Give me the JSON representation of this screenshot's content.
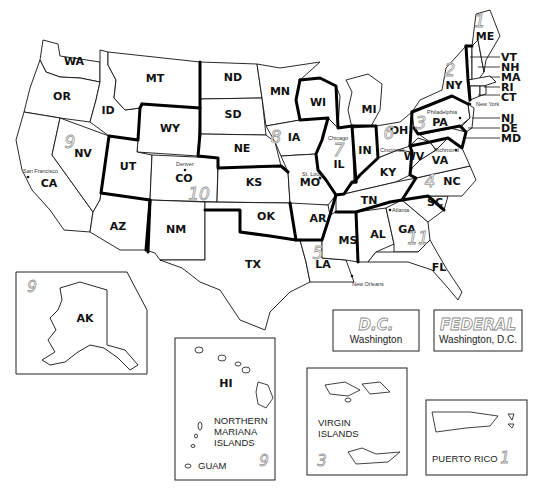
{
  "states": [
    {
      "code": "WA",
      "x": 74,
      "y": 65
    },
    {
      "code": "OR",
      "x": 62,
      "y": 100
    },
    {
      "code": "CA",
      "x": 49,
      "y": 187
    },
    {
      "code": "NV",
      "x": 83,
      "y": 157
    },
    {
      "code": "ID",
      "x": 108,
      "y": 114
    },
    {
      "code": "MT",
      "x": 155,
      "y": 82
    },
    {
      "code": "WY",
      "x": 170,
      "y": 132
    },
    {
      "code": "UT",
      "x": 128,
      "y": 170
    },
    {
      "code": "CO",
      "x": 184,
      "y": 182
    },
    {
      "code": "AZ",
      "x": 118,
      "y": 230
    },
    {
      "code": "NM",
      "x": 176,
      "y": 233
    },
    {
      "code": "ND",
      "x": 233,
      "y": 81
    },
    {
      "code": "SD",
      "x": 233,
      "y": 118
    },
    {
      "code": "NE",
      "x": 242,
      "y": 152
    },
    {
      "code": "KS",
      "x": 254,
      "y": 186
    },
    {
      "code": "OK",
      "x": 266,
      "y": 220
    },
    {
      "code": "TX",
      "x": 253,
      "y": 268
    },
    {
      "code": "MN",
      "x": 280,
      "y": 95
    },
    {
      "code": "IA",
      "x": 294,
      "y": 141
    },
    {
      "code": "MO",
      "x": 310,
      "y": 186
    },
    {
      "code": "AR",
      "x": 318,
      "y": 222
    },
    {
      "code": "LA",
      "x": 323,
      "y": 268
    },
    {
      "code": "WI",
      "x": 318,
      "y": 106
    },
    {
      "code": "IL",
      "x": 339,
      "y": 165
    },
    {
      "code": "MI",
      "x": 369,
      "y": 113
    },
    {
      "code": "IN",
      "x": 365,
      "y": 154
    },
    {
      "code": "OH",
      "x": 399,
      "y": 132
    },
    {
      "code": "KY",
      "x": 388,
      "y": 174
    },
    {
      "code": "TN",
      "x": 369,
      "y": 204
    },
    {
      "code": "MS",
      "x": 348,
      "y": 241
    },
    {
      "code": "AL",
      "x": 378,
      "y": 236
    },
    {
      "code": "GA",
      "x": 407,
      "y": 233
    },
    {
      "code": "FL",
      "x": 439,
      "y": 271
    },
    {
      "code": "SC",
      "x": 435,
      "y": 204
    },
    {
      "code": "NC",
      "x": 452,
      "y": 182
    },
    {
      "code": "VA",
      "x": 440,
      "y": 162
    },
    {
      "code": "WV",
      "x": 414,
      "y": 156
    },
    {
      "code": "PA",
      "x": 440,
      "y": 122
    },
    {
      "code": "NY",
      "x": 454,
      "y": 85
    },
    {
      "code": "ME",
      "x": 485,
      "y": 37
    }
  ],
  "leader_labels": [
    {
      "code": "VT",
      "y": 57
    },
    {
      "code": "NH",
      "y": 67
    },
    {
      "code": "MA",
      "y": 77
    },
    {
      "code": "RI",
      "y": 87
    },
    {
      "code": "CT",
      "y": 97
    },
    {
      "code": "NJ",
      "y": 118
    },
    {
      "code": "DE",
      "y": 128
    },
    {
      "code": "MD",
      "y": 138
    }
  ],
  "cities": [
    {
      "name": "San Francisco",
      "x": 23,
      "y": 170
    },
    {
      "name": "Denver",
      "x": 176,
      "y": 164
    },
    {
      "name": "St. Louis",
      "x": 300,
      "y": 174
    },
    {
      "name": "Chicago",
      "x": 328,
      "y": 138
    },
    {
      "name": "Cincinnati",
      "x": 382,
      "y": 150
    },
    {
      "name": "Philadelphia",
      "x": 426,
      "y": 112
    },
    {
      "name": "New York",
      "x": 476,
      "y": 104
    },
    {
      "name": "Richmond",
      "x": 432,
      "y": 150
    },
    {
      "name": "Atlanta",
      "x": 390,
      "y": 210
    },
    {
      "name": "New Orleans",
      "x": 352,
      "y": 285
    }
  ],
  "circuit_numbers": [
    {
      "n": "1",
      "x": 480,
      "y": 27
    },
    {
      "n": "2",
      "x": 450,
      "y": 75
    },
    {
      "n": "3",
      "x": 421,
      "y": 127
    },
    {
      "n": "4",
      "x": 430,
      "y": 185
    },
    {
      "n": "5",
      "x": 318,
      "y": 257
    },
    {
      "n": "6",
      "x": 389,
      "y": 137
    },
    {
      "n": "7",
      "x": 339,
      "y": 154
    },
    {
      "n": "8",
      "x": 276,
      "y": 141
    },
    {
      "n": "9",
      "x": 70,
      "y": 146
    },
    {
      "n": "10",
      "x": 199,
      "y": 198
    },
    {
      "n": "11",
      "x": 418,
      "y": 242
    }
  ],
  "insets": {
    "alaska": {
      "label": "AK",
      "circuit": "9"
    },
    "hawaii": {
      "label": "HI",
      "territory": [
        "NORTHERN",
        "MARIANA",
        "ISLANDS"
      ],
      "guam": "GUAM",
      "circuit": "9"
    },
    "virgin_islands": {
      "lines": [
        "VIRGIN",
        "ISLANDS"
      ],
      "circuit": "3"
    },
    "puerto_rico": {
      "label": "PUERTO RICO",
      "circuit": "1"
    },
    "dc": {
      "title": "D.C.",
      "subtitle": "Washington"
    },
    "federal": {
      "title": "FEDERAL",
      "subtitle": "Washington, D.C."
    }
  }
}
